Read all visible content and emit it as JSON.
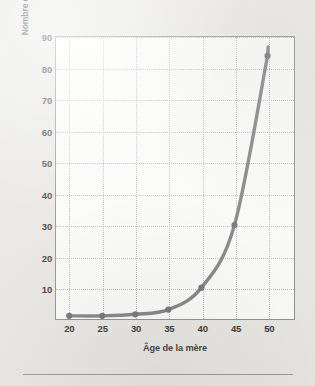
{
  "figure": {
    "background_color": "#e9e8e4",
    "plot_background_color": "#fdfdfc",
    "frame_color": "#8e8e8e",
    "curve_color": "#808080",
    "gridline_color": "#b9b9b9"
  },
  "chart_data": {
    "type": "line",
    "title": "",
    "xlabel": "Âge de la mère",
    "ylabel": "Nombre d'enfants trisomiques par 1000 naissances",
    "x": [
      20,
      25,
      30,
      35,
      40,
      45,
      50
    ],
    "values": [
      1,
      1,
      1.5,
      3,
      10,
      30,
      84
    ],
    "series": [
      {
        "name": "Nombre d'enfants trisomiques par 1000 naissances",
        "values": [
          1,
          1,
          1.5,
          3,
          10,
          30,
          84
        ]
      }
    ],
    "xlim": [
      18,
      54
    ],
    "ylim": [
      0,
      90
    ],
    "xticks": [
      20,
      25,
      30,
      35,
      40,
      45,
      50
    ],
    "xtick_labels": [
      "20",
      "25",
      "30",
      "35",
      "40",
      "45",
      "50"
    ],
    "yticks": [
      10,
      20,
      30,
      40,
      50,
      60,
      70,
      80,
      90
    ],
    "ytick_labels": [
      "10",
      "20",
      "30",
      "40",
      "50",
      "60",
      "70",
      "80",
      "90"
    ],
    "grid": true,
    "grid_style": "dotted",
    "legend": false,
    "markers": "circle",
    "line_width": 3
  }
}
